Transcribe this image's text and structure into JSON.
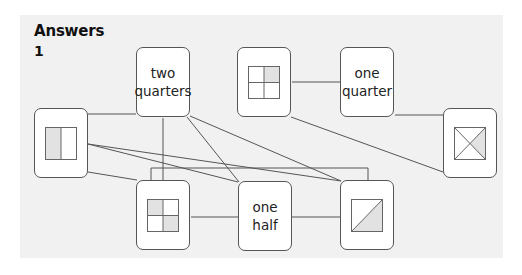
{
  "heading": "Answers",
  "question_number": "1",
  "colors": {
    "panel": "#f1f1f1",
    "shade": "#e2e2e2",
    "line": "#555555"
  },
  "cards": [
    {
      "id": "half-vertical",
      "type": "shape",
      "shape": "half-vertical-left-shaded",
      "x": 34,
      "y": 108
    },
    {
      "id": "two-quarters",
      "type": "label",
      "line1": "two",
      "line2": "quarters",
      "x": 136,
      "y": 47
    },
    {
      "id": "quarter-grid-top",
      "type": "shape",
      "shape": "grid-top-right-shaded",
      "x": 237,
      "y": 47
    },
    {
      "id": "one-quarter",
      "type": "label",
      "line1": "one",
      "line2": "quarter",
      "x": 340,
      "y": 47
    },
    {
      "id": "cross-square",
      "type": "shape",
      "shape": "x-right-triangle-shaded",
      "x": 443,
      "y": 108
    },
    {
      "id": "quarter-grid-bottom",
      "type": "shape",
      "shape": "grid-diagonal-two-shaded",
      "x": 136,
      "y": 180
    },
    {
      "id": "one-half",
      "type": "label",
      "line1": "one",
      "line2": "half",
      "x": 238,
      "y": 181
    },
    {
      "id": "diagonal-square",
      "type": "shape",
      "shape": "diagonal-lower-right-shaded",
      "x": 340,
      "y": 180
    }
  ],
  "connections": [
    [
      "half-vertical",
      "two-quarters"
    ],
    [
      "half-vertical",
      "one-half"
    ],
    [
      "half-vertical",
      "diagonal-square"
    ],
    [
      "half-vertical",
      "quarter-grid-bottom"
    ],
    [
      "two-quarters",
      "quarter-grid-bottom"
    ],
    [
      "two-quarters",
      "one-half"
    ],
    [
      "two-quarters",
      "diagonal-square"
    ],
    [
      "quarter-grid-top",
      "one-quarter"
    ],
    [
      "quarter-grid-top",
      "cross-square"
    ],
    [
      "one-quarter",
      "cross-square"
    ],
    [
      "quarter-grid-bottom",
      "one-half"
    ],
    [
      "quarter-grid-bottom",
      "diagonal-square"
    ],
    [
      "one-half",
      "diagonal-square"
    ]
  ]
}
